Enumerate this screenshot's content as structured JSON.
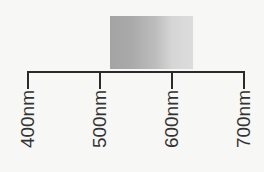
{
  "diagram": {
    "title": "",
    "swatch": {
      "description": "grayscale gradient band",
      "colors": [
        "#a4a4a4",
        "#dcdcdc"
      ]
    },
    "axis": {
      "ticks": [
        {
          "label": "400nm",
          "x": 28
        },
        {
          "label": "500nm",
          "x": 100
        },
        {
          "label": "600nm",
          "x": 172
        },
        {
          "label": "700nm",
          "x": 244
        }
      ]
    }
  }
}
